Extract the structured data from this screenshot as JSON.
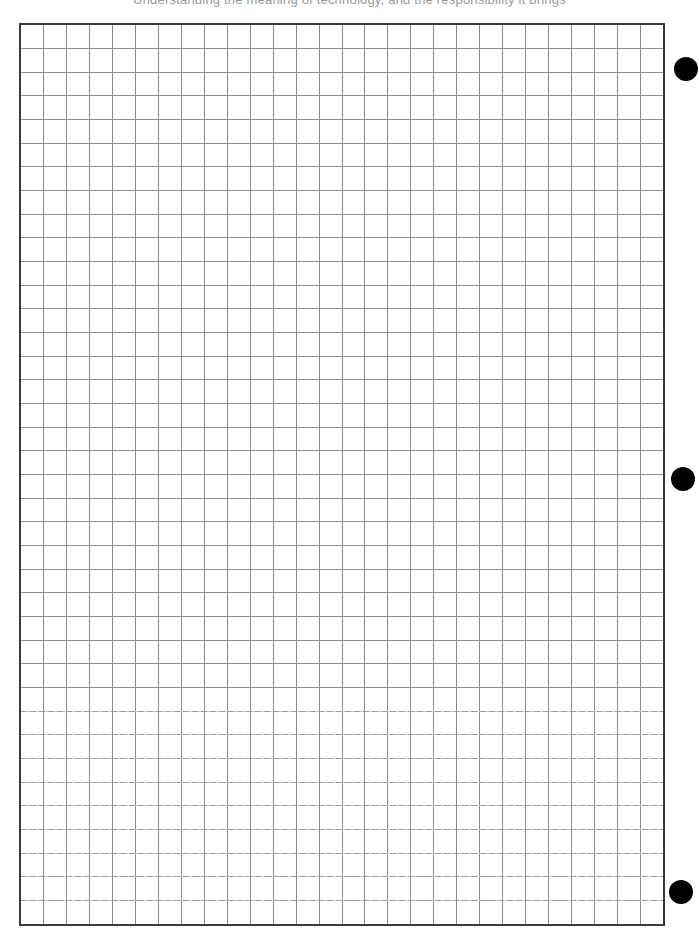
{
  "page": {
    "header_text": "Understanding the meaning of technology, and the responsibility it brings"
  },
  "sheet": {
    "type": "graph-paper",
    "columns": 28,
    "rows": 38,
    "border_color": "#3a3a3a",
    "grid_color": "#8c8c8c"
  },
  "holes": [
    {
      "name": "top",
      "cx": 686,
      "cy": 69,
      "r": 12
    },
    {
      "name": "middle",
      "cx": 683,
      "cy": 479,
      "r": 12
    },
    {
      "name": "bottom",
      "cx": 681,
      "cy": 892,
      "r": 12
    }
  ]
}
